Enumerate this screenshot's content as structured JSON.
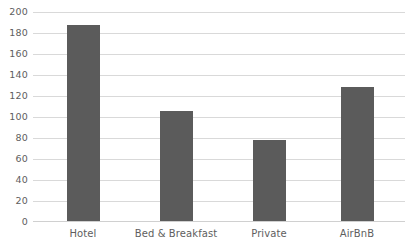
{
  "chart_data": {
    "type": "bar",
    "title": "",
    "subtitle": "",
    "xlabel": "",
    "ylabel": "",
    "categories": [
      "Hotel",
      "Bed & Breakfast",
      "Private",
      "AirBnB"
    ],
    "values": [
      188,
      105,
      78,
      128
    ],
    "series": [
      {
        "name": "Count",
        "values": [
          188,
          105,
          78,
          128
        ]
      }
    ],
    "ylim": [
      0,
      200
    ],
    "ytick_step": 20,
    "ytick_labels": [
      "200",
      "180",
      "160",
      "140",
      "120",
      "100",
      "80",
      "60",
      "40",
      "20",
      "0"
    ],
    "ytick_values": [
      200,
      180,
      160,
      140,
      120,
      100,
      80,
      60,
      40,
      20,
      0
    ],
    "grid": true,
    "grid_axis": "y",
    "legend": false,
    "legend_position": "none",
    "annotations": [],
    "colors": {
      "bar": "#5b5b5b",
      "gridline": "#d9d9d9",
      "baseline": "#d0d0d0",
      "tick_label": "#5e5e5e",
      "background": "#ffffff"
    }
  }
}
